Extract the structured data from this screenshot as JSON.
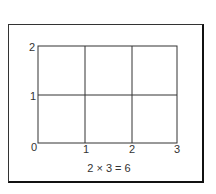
{
  "diagram": {
    "title": "",
    "grid": {
      "columns": 3,
      "rows": 2,
      "x_ticks": [
        "0",
        "1",
        "2",
        "3"
      ],
      "y_ticks": [
        "0",
        "1",
        "2"
      ]
    },
    "equation": "2 × 3 = 6",
    "colors": {
      "line": "#333333",
      "frame": "#222222",
      "background": "#ffffff"
    }
  }
}
